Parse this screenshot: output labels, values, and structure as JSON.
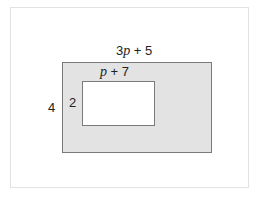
{
  "diagram": {
    "outer_rect": {
      "width_label_coef": "3",
      "width_label_var": "p",
      "width_label_rest": " + 5",
      "height_label": "4",
      "fill": "#e3e3e3"
    },
    "inner_rect": {
      "width_label_var": "p",
      "width_label_rest": " + 7",
      "height_label": "2",
      "fill": "#ffffff"
    }
  }
}
